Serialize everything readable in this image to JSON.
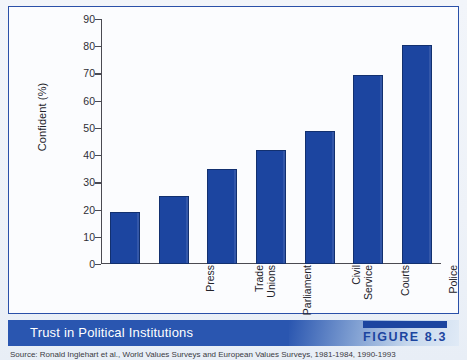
{
  "figure": {
    "caption": "Trust in Political Institutions",
    "badge_label": "FIGURE 8.3",
    "source_note": "Source:  Ronald Inglehart et al., World Values Surveys and European Values Surveys, 1981-1984, 1990-1993",
    "accent_color": "#1c45a0",
    "caption_bar_color": "#2a56b0",
    "panel_border_color": "#2a50a8"
  },
  "chart_data": {
    "type": "bar",
    "title": "Trust in Political Institutions",
    "xlabel": "",
    "ylabel": "Confident (%)",
    "categories": [
      "Press",
      "Trade\nUnions",
      "Parliament",
      "Civil\nService",
      "Courts",
      "Police",
      "Armed\nForces"
    ],
    "values": [
      19,
      25,
      35,
      42,
      49,
      69.5,
      80.5
    ],
    "ylim": [
      0,
      90
    ],
    "yticks": [
      0,
      10,
      20,
      30,
      40,
      50,
      60,
      70,
      80,
      90
    ],
    "grid": false,
    "legend": "none",
    "bar_color": "#1c45a0",
    "bar_edge_color": "#12306f"
  }
}
